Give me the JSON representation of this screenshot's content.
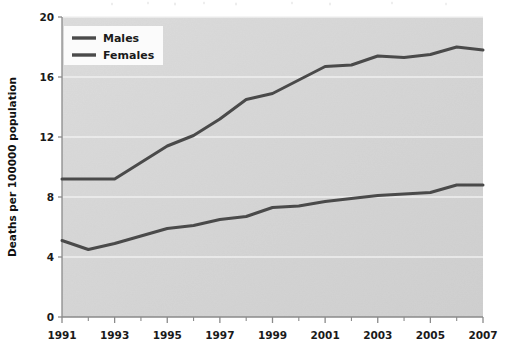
{
  "chart_data": {
    "type": "line",
    "title": "",
    "subtitle": "",
    "xlabel": "",
    "ylabel": "Deaths per 100000 population",
    "xlim": [
      1991,
      2007
    ],
    "ylim": [
      0,
      20
    ],
    "grid": true,
    "grid_axis": "y",
    "legend_position": "top-left",
    "x": [
      1991,
      1992,
      1993,
      1994,
      1995,
      1996,
      1997,
      1998,
      1999,
      2000,
      2001,
      2002,
      2003,
      2004,
      2005,
      2006,
      2007
    ],
    "xtick_labels": [
      "1991",
      "1993",
      "1995",
      "1997",
      "1999",
      "2001",
      "2003",
      "2005",
      "2007"
    ],
    "xtick_values": [
      1991,
      1993,
      1995,
      1997,
      1999,
      2001,
      2003,
      2005,
      2007
    ],
    "xtick_minor_values": [
      1992,
      1994,
      1996,
      1998,
      2000,
      2002,
      2004,
      2006
    ],
    "ytick_labels": [
      "0",
      "4",
      "8",
      "12",
      "16",
      "20"
    ],
    "ytick_values": [
      0,
      4,
      8,
      12,
      16,
      20
    ],
    "series": [
      {
        "name": "Males",
        "color": "#4a4a4a",
        "values": [
          9.2,
          9.2,
          9.2,
          10.3,
          11.4,
          12.1,
          13.2,
          14.5,
          14.9,
          15.8,
          16.7,
          16.8,
          17.4,
          17.3,
          17.5,
          18.0,
          17.8
        ]
      },
      {
        "name": "Females",
        "color": "#4a4a4a",
        "values": [
          5.1,
          4.5,
          4.9,
          5.4,
          5.9,
          6.1,
          6.5,
          6.7,
          7.3,
          7.4,
          7.7,
          7.9,
          8.1,
          8.2,
          8.3,
          8.8,
          8.8
        ]
      }
    ]
  },
  "legend": {
    "items": [
      {
        "label": "Males"
      },
      {
        "label": "Females"
      }
    ]
  },
  "axes": {
    "y_title": "Deaths per 100000 population"
  },
  "colors": {
    "plot_background": "#d5d5d5",
    "page_background": "#ffffff",
    "line": "#4a4a4a",
    "gridline": "#f2f2f2",
    "axis": "#808080",
    "text": "#1a1a1a"
  }
}
